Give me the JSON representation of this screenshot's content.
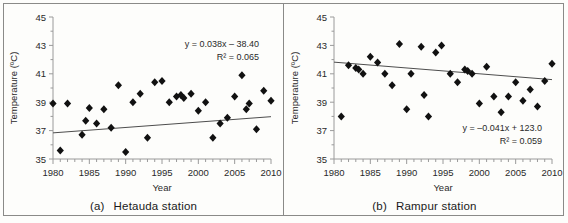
{
  "figure": {
    "panels": [
      {
        "id": "a",
        "caption_tag": "(a)",
        "caption_text": "Hetauda station",
        "equation": "y = 0.038x – 38.40",
        "r_squared": "R² = 0.065"
      },
      {
        "id": "b",
        "caption_tag": "(b)",
        "caption_text": "Rampur station",
        "equation": "y = –0.041x + 123.0",
        "r_squared": "R² = 0.059"
      }
    ]
  },
  "chart_data": [
    {
      "type": "scatter",
      "title": "(a) Hetauda station",
      "xlabel": "Year",
      "ylabel": "Temperature (ºC)",
      "xlim": [
        1980,
        2010
      ],
      "ylim": [
        35,
        45
      ],
      "xticks": [
        1980,
        1985,
        1990,
        1995,
        2000,
        2005,
        2010
      ],
      "yticks": [
        35,
        37,
        39,
        41,
        43,
        45
      ],
      "xtick_minor_step": 1,
      "grid": false,
      "legend": null,
      "marker": "diamond",
      "marker_color": "#111111",
      "annotations": [
        "y = 0.038x – 38.40",
        "R² = 0.065"
      ],
      "trendline": {
        "slope": 0.038,
        "intercept": -38.4,
        "equation": "y = 0.038x – 38.40",
        "r_squared": 0.065,
        "color": "#4d4d4d"
      },
      "x": [
        1980,
        1981,
        1982,
        1984,
        1985,
        1986,
        1987,
        1988,
        1989,
        1990,
        1991,
        1992,
        1993,
        1994,
        1995,
        1996,
        1997,
        1997.6,
        1998,
        1999,
        2000,
        2001,
        2002,
        2003,
        2004,
        2005,
        2006,
        2007,
        2007.6,
        2008,
        2009,
        2010
      ],
      "y": [
        38.9,
        35.6,
        38.9,
        36.7,
        37.7,
        38.6,
        37.5,
        38.5,
        37.2,
        40.2,
        35.5,
        39.0,
        39.6,
        36.5,
        40.4,
        40.5,
        39.0,
        39.4,
        39.5,
        39.4,
        39.6,
        38.4,
        39.0,
        36.5,
        37.5,
        37.9,
        39.4,
        40.9,
        38.5,
        38.9,
        37.1,
        39.8,
        39.1
      ],
      "points": [
        {
          "x": 1980,
          "y": 38.9
        },
        {
          "x": 1981,
          "y": 35.6
        },
        {
          "x": 1982,
          "y": 38.9
        },
        {
          "x": 1984,
          "y": 36.7
        },
        {
          "x": 1984.5,
          "y": 37.7
        },
        {
          "x": 1985,
          "y": 38.6
        },
        {
          "x": 1986,
          "y": 37.5
        },
        {
          "x": 1987,
          "y": 38.5
        },
        {
          "x": 1988,
          "y": 37.2
        },
        {
          "x": 1989,
          "y": 40.2
        },
        {
          "x": 1990,
          "y": 35.5
        },
        {
          "x": 1991,
          "y": 39.0
        },
        {
          "x": 1992,
          "y": 39.6
        },
        {
          "x": 1993,
          "y": 36.5
        },
        {
          "x": 1994,
          "y": 40.4
        },
        {
          "x": 1995,
          "y": 40.5
        },
        {
          "x": 1996,
          "y": 39.0
        },
        {
          "x": 1997,
          "y": 39.4
        },
        {
          "x": 1997.6,
          "y": 39.5
        },
        {
          "x": 1998,
          "y": 39.3
        },
        {
          "x": 1999,
          "y": 39.6
        },
        {
          "x": 2000,
          "y": 38.4
        },
        {
          "x": 2001,
          "y": 39.0
        },
        {
          "x": 2002,
          "y": 36.5
        },
        {
          "x": 2003,
          "y": 37.5
        },
        {
          "x": 2004,
          "y": 37.9
        },
        {
          "x": 2005,
          "y": 39.4
        },
        {
          "x": 2006,
          "y": 40.9
        },
        {
          "x": 2006.6,
          "y": 38.5
        },
        {
          "x": 2007,
          "y": 38.9
        },
        {
          "x": 2008,
          "y": 37.1
        },
        {
          "x": 2009,
          "y": 39.8
        },
        {
          "x": 2010,
          "y": 39.1
        }
      ]
    },
    {
      "type": "scatter",
      "title": "(b) Rampur station",
      "xlabel": "Year",
      "ylabel": "Temperature (ºC)",
      "xlim": [
        1980,
        2010
      ],
      "ylim": [
        35,
        45
      ],
      "xticks": [
        1980,
        1985,
        1990,
        1995,
        2000,
        2005,
        2010
      ],
      "yticks": [
        35,
        37,
        39,
        41,
        43,
        45
      ],
      "xtick_minor_step": 1,
      "grid": false,
      "legend": null,
      "marker": "diamond",
      "marker_color": "#111111",
      "annotations": [
        "y = –0.041x + 123.0",
        "R² = 0.059"
      ],
      "trendline": {
        "slope": -0.041,
        "intercept": 123.0,
        "equation": "y = –0.041x + 123.0",
        "r_squared": 0.059,
        "color": "#4d4d4d"
      },
      "points": [
        {
          "x": 1981,
          "y": 38.0
        },
        {
          "x": 1982,
          "y": 41.6
        },
        {
          "x": 1983,
          "y": 41.4
        },
        {
          "x": 1983.4,
          "y": 41.3
        },
        {
          "x": 1984,
          "y": 41.0
        },
        {
          "x": 1985,
          "y": 42.2
        },
        {
          "x": 1986,
          "y": 41.8
        },
        {
          "x": 1987,
          "y": 41.0
        },
        {
          "x": 1988,
          "y": 40.2
        },
        {
          "x": 1989,
          "y": 43.1
        },
        {
          "x": 1990,
          "y": 38.5
        },
        {
          "x": 1990.6,
          "y": 41.0
        },
        {
          "x": 1992,
          "y": 42.9
        },
        {
          "x": 1992.4,
          "y": 39.5
        },
        {
          "x": 1993,
          "y": 38.0
        },
        {
          "x": 1994,
          "y": 42.5
        },
        {
          "x": 1994.8,
          "y": 43.0
        },
        {
          "x": 1996,
          "y": 41.0
        },
        {
          "x": 1997,
          "y": 40.4
        },
        {
          "x": 1998,
          "y": 41.3
        },
        {
          "x": 1998.4,
          "y": 41.2
        },
        {
          "x": 1999,
          "y": 41.0
        },
        {
          "x": 2000,
          "y": 38.9
        },
        {
          "x": 2001,
          "y": 41.5
        },
        {
          "x": 2002,
          "y": 39.4
        },
        {
          "x": 2003,
          "y": 38.3
        },
        {
          "x": 2004,
          "y": 39.4
        },
        {
          "x": 2005,
          "y": 40.4
        },
        {
          "x": 2006,
          "y": 39.1
        },
        {
          "x": 2007,
          "y": 39.9
        },
        {
          "x": 2008,
          "y": 38.7
        },
        {
          "x": 2009,
          "y": 40.5
        },
        {
          "x": 2010,
          "y": 41.7
        }
      ]
    }
  ]
}
